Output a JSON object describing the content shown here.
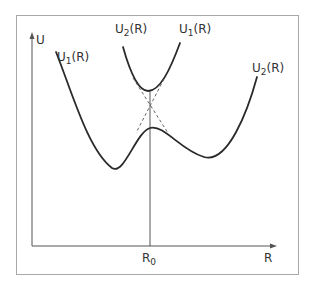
{
  "diagram": {
    "axes": {
      "y_label": "U",
      "x_label": "R",
      "x_marker": {
        "base": "R",
        "sub": "0"
      }
    },
    "labels": {
      "u1_left": {
        "base": "U",
        "sub": "1",
        "suffix": "(R)"
      },
      "u2_upper": {
        "base": "U",
        "sub": "2",
        "suffix": "(R)"
      },
      "u1_upper": {
        "base": "U",
        "sub": "1",
        "suffix": "(R)"
      },
      "u2_right": {
        "base": "U",
        "sub": "2",
        "suffix": "(R)"
      }
    },
    "colors": {
      "ink": "#2a2a2a",
      "frame": "#9a9a9a",
      "background": "#ffffff"
    }
  }
}
